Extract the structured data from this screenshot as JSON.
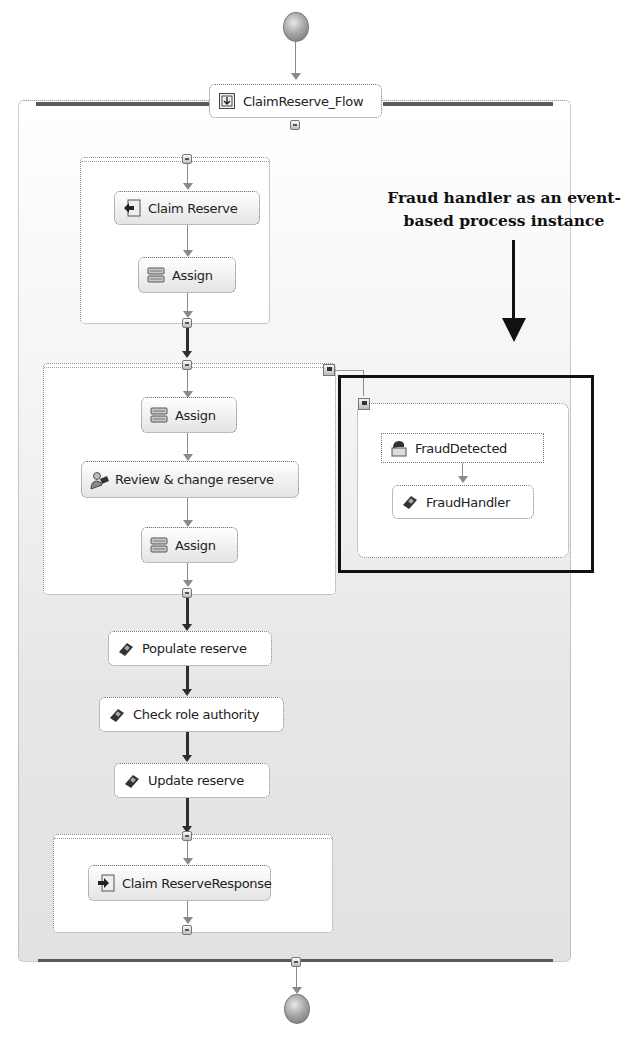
{
  "process": {
    "name": "ClaimReserve_Flow",
    "start_event": "start",
    "end_event": "end"
  },
  "scopes": [
    {
      "id": "receive-scope",
      "nodes": [
        {
          "label": "Claim Reserve",
          "icon": "receive-icon"
        },
        {
          "label": "Assign",
          "icon": "assign-icon"
        }
      ]
    },
    {
      "id": "review-scope",
      "nodes": [
        {
          "label": "Assign",
          "icon": "assign-icon"
        },
        {
          "label": "Review & change reserve",
          "icon": "human-task-icon"
        },
        {
          "label": "Assign",
          "icon": "assign-icon"
        }
      ]
    },
    {
      "id": "reply-scope",
      "nodes": [
        {
          "label": "Claim ReserveResponse",
          "icon": "reply-icon"
        }
      ]
    }
  ],
  "sequence": [
    {
      "label": "Populate reserve",
      "icon": "invoke-icon"
    },
    {
      "label": "Check role authority",
      "icon": "invoke-icon"
    },
    {
      "label": "Update reserve",
      "icon": "invoke-icon"
    }
  ],
  "event_handler": {
    "event": {
      "label": "FraudDetected",
      "icon": "event-icon"
    },
    "handler": {
      "label": "FraudHandler",
      "icon": "invoke-icon"
    }
  },
  "annotation": {
    "line1": "Fraud handler as an event-",
    "line2": "based process instance"
  }
}
